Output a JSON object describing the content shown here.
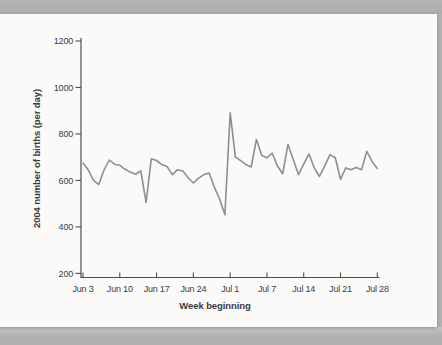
{
  "page": {
    "background_color": "#b3b0b1",
    "card_color": "#fbfaf9"
  },
  "chart_data": {
    "type": "line",
    "title": "",
    "xlabel": "Week beginning",
    "ylabel": "2004 number of births (per day)",
    "x_tick_labels": [
      "Jun 3",
      "Jun 10",
      "Jun 17",
      "Jun 24",
      "Jul 1",
      "Jul 7",
      "Jul 14",
      "Jul 21",
      "Jul 28"
    ],
    "x_tick_indices": [
      0,
      7,
      14,
      21,
      28,
      35,
      42,
      49,
      56
    ],
    "y_ticks": [
      200,
      400,
      600,
      800,
      1000,
      1200
    ],
    "ylim": [
      200,
      1200
    ],
    "grid": false,
    "legend": "none",
    "colors": {
      "line": "#8f8f8f",
      "axis": "#4d4d4d",
      "text": "#3c3c3c"
    },
    "series": [
      {
        "name": "births per day",
        "values": [
          675,
          645,
          600,
          582,
          645,
          688,
          670,
          665,
          648,
          636,
          627,
          641,
          505,
          693,
          686,
          668,
          660,
          625,
          646,
          640,
          612,
          589,
          610,
          625,
          632,
          570,
          520,
          452,
          891,
          700,
          685,
          668,
          658,
          776,
          708,
          697,
          718,
          662,
          629,
          755,
          690,
          625,
          670,
          714,
          655,
          617,
          663,
          711,
          698,
          605,
          654,
          646,
          656,
          646,
          725,
          682,
          652
        ]
      }
    ]
  }
}
